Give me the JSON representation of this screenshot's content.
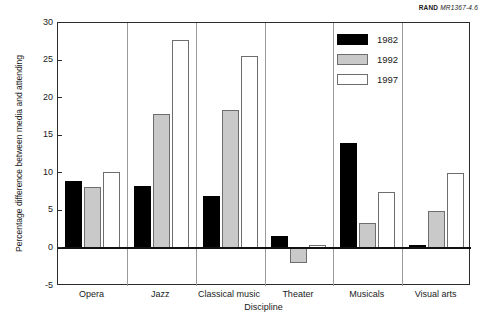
{
  "source_credit": {
    "organization": "RAND",
    "document_id": "MR1367-4.6"
  },
  "legend": {
    "position": "top-right",
    "entries": [
      {
        "label": "1982",
        "color": "#000000"
      },
      {
        "label": "1992",
        "color": "#c9c9c9"
      },
      {
        "label": "1997",
        "color": "#ffffff"
      }
    ]
  },
  "chart_data": {
    "type": "bar",
    "title": "",
    "subtitle": "",
    "xlabel": "Discipline",
    "ylabel": "Percentage difference between media and attending",
    "categories": [
      "Opera",
      "Jazz",
      "Classical music",
      "Theater",
      "Musicals",
      "Visual arts"
    ],
    "series": [
      {
        "name": "1982",
        "color": "#000000",
        "values": [
          9.0,
          8.3,
          7.0,
          1.6,
          14.0,
          0.4
        ]
      },
      {
        "name": "1992",
        "color": "#c9c9c9",
        "values": [
          8.2,
          17.9,
          18.4,
          -2.0,
          3.4,
          5.0
        ]
      },
      {
        "name": "1997",
        "color": "#ffffff",
        "values": [
          10.2,
          27.7,
          25.6,
          0.4,
          7.5,
          10.1
        ]
      }
    ],
    "ylim": [
      -5,
      30
    ],
    "yticks": [
      -5,
      0,
      5,
      10,
      15,
      20,
      25,
      30
    ],
    "ytick_labels": [
      "-5",
      "0",
      "5",
      "10",
      "15",
      "20",
      "25",
      "30"
    ],
    "grid": false,
    "legend_position": "upper right",
    "zero_line": true
  }
}
